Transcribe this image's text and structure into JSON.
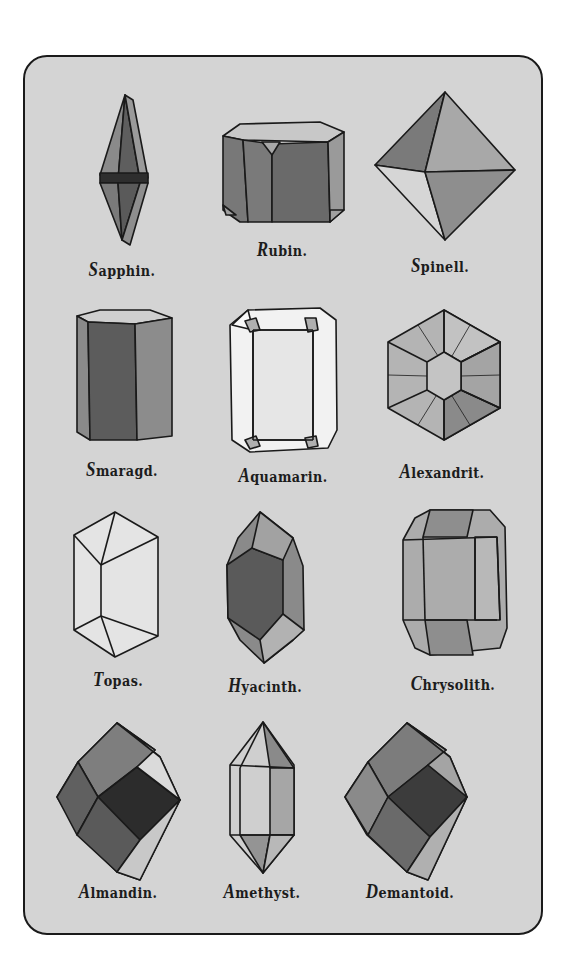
{
  "plate": {
    "background": "#d4d4d4",
    "border_color": "#1a1a1a"
  },
  "gems": [
    {
      "name": "Sapphin.",
      "cap": "S",
      "rest": "apphin."
    },
    {
      "name": "Rubin.",
      "cap": "R",
      "rest": "ubin."
    },
    {
      "name": "Spinell.",
      "cap": "S",
      "rest": "pinell."
    },
    {
      "name": "Smaragd.",
      "cap": "S",
      "rest": "maragd."
    },
    {
      "name": "Aquamarin.",
      "cap": "A",
      "rest": "quamarin."
    },
    {
      "name": "Alexandrit.",
      "cap": "A",
      "rest": "lexandrit."
    },
    {
      "name": "Topas.",
      "cap": "T",
      "rest": "opas."
    },
    {
      "name": "Hyacinth.",
      "cap": "H",
      "rest": "yacinth."
    },
    {
      "name": "Chrysolith.",
      "cap": "C",
      "rest": "hrysolith."
    },
    {
      "name": "Almandin.",
      "cap": "A",
      "rest": "lmandin."
    },
    {
      "name": "Amethyst.",
      "cap": "A",
      "rest": "methyst."
    },
    {
      "name": "Demantoid.",
      "cap": "D",
      "rest": "emantoid."
    }
  ]
}
